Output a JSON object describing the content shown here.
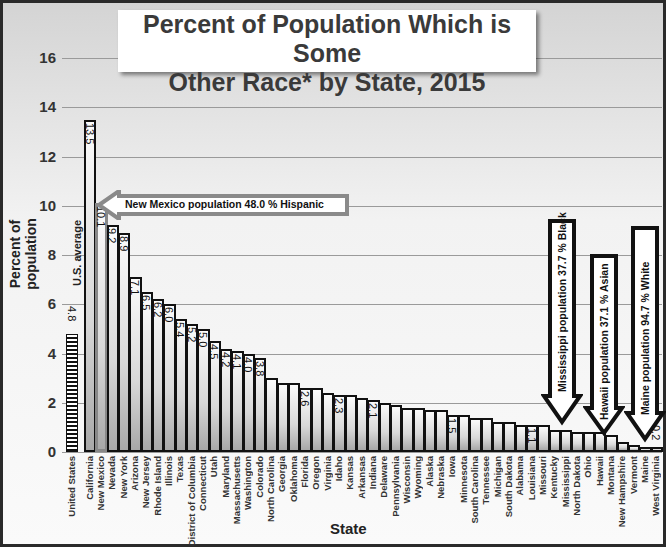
{
  "chart_data": {
    "type": "bar",
    "title": "Percent of Population Which is Some Other Race* by State, 2015",
    "title_lines": [
      "Percent of Population Which is Some",
      "Other Race* by State, 2015"
    ],
    "xlabel": "State",
    "ylabel": "Percent of population",
    "ylim": [
      0,
      16
    ],
    "yticks": [
      0,
      2,
      4,
      6,
      8,
      10,
      12,
      14,
      16
    ],
    "grid": true,
    "categories": [
      "United States",
      "California",
      "New Mexico",
      "Nevada",
      "New York",
      "Arizona",
      "New Jersey",
      "Rhode Island",
      "Illinois",
      "Texas",
      "District of Columbia",
      "Connecticut",
      "Utah",
      "Maryland",
      "Massachusetts",
      "Washington",
      "Colorado",
      "North Carolina",
      "Georgia",
      "Oklahoma",
      "Florida",
      "Oregon",
      "Virginia",
      "Idaho",
      "Kansas",
      "Arkansas",
      "Indiana",
      "Delaware",
      "Pennsylvania",
      "Wisconsin",
      "Wyoming",
      "Alaska",
      "Nebraska",
      "Iowa",
      "Minnesota",
      "South Carolina",
      "Tennessee",
      "Michigan",
      "South Dakota",
      "Alabama",
      "Louisiana",
      "Missouri",
      "Kentucky",
      "Mississippi",
      "North Dakota",
      "Ohio",
      "Hawaii",
      "Montana",
      "New Hampshire",
      "Vermont",
      "Maine",
      "West Virginia"
    ],
    "values": [
      4.8,
      13.5,
      10.1,
      9.2,
      8.9,
      7.1,
      6.5,
      6.2,
      6.0,
      5.4,
      5.2,
      5.0,
      4.5,
      4.2,
      4.1,
      4.0,
      3.8,
      3.0,
      2.8,
      2.8,
      2.6,
      2.6,
      2.4,
      2.3,
      2.3,
      2.2,
      2.1,
      2.0,
      1.9,
      1.8,
      1.8,
      1.7,
      1.7,
      1.5,
      1.5,
      1.4,
      1.4,
      1.2,
      1.2,
      1.1,
      1.1,
      1.1,
      0.9,
      0.9,
      0.8,
      0.8,
      0.8,
      0.7,
      0.4,
      0.3,
      0.2,
      0.2
    ],
    "data_labels": {
      "United States": "4.8",
      "California": "13.5",
      "New Mexico": "10.1",
      "Nevada": "9.2",
      "New York": "8.9",
      "Arizona": "7.1",
      "New Jersey": "6.5",
      "Rhode Island": "6.2",
      "Illinois": "6.0",
      "Texas": "5.4",
      "District of Columbia": "5.2",
      "Connecticut": "5.0",
      "Utah": "4.5",
      "Maryland": "4.2",
      "Massachusetts": "4.1",
      "Washington": "4.0",
      "Colorado": "3.8",
      "Florida": "2.6",
      "Idaho": "2.3",
      "Indiana": "2.1",
      "Iowa": "1.5",
      "Louisiana": "1.1",
      "West Virginia": "0.2"
    },
    "annotations": [
      {
        "text": "U.S. average",
        "target": "United States"
      },
      {
        "text": "New Mexico population 48.0 % Hispanic",
        "target": "New Mexico",
        "direction": "left"
      },
      {
        "text": "Mississippi population 37.7 % Black",
        "target": "Mississippi",
        "direction": "down"
      },
      {
        "text": "Hawaii population 37.1 % Asian",
        "target": "Hawaii",
        "direction": "down"
      },
      {
        "text": "Maine population 94.7 % White",
        "target": "Maine",
        "direction": "down"
      }
    ]
  }
}
